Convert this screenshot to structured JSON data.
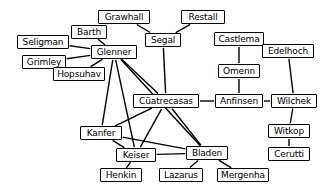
{
  "diagram": {
    "type": "undirected-node-link-graph",
    "width": 330,
    "height": 192,
    "background_color": "#ffffff",
    "node_fill_color": "#ffffff",
    "node_border_color": "#000000",
    "edge_color": "#000000"
  },
  "nodes": [
    {
      "id": "grawhall",
      "label": "Grawhall",
      "x": 124,
      "y": 17,
      "w": 52,
      "h": 14
    },
    {
      "id": "restall",
      "label": "Restall",
      "x": 203,
      "y": 17,
      "w": 44,
      "h": 14
    },
    {
      "id": "barth",
      "label": "Barth",
      "x": 89,
      "y": 32,
      "w": 36,
      "h": 14
    },
    {
      "id": "segal",
      "label": "Segal",
      "x": 163,
      "y": 40,
      "w": 36,
      "h": 14
    },
    {
      "id": "castlema",
      "label": "Castlema",
      "x": 239,
      "y": 39,
      "w": 50,
      "h": 14
    },
    {
      "id": "seligman",
      "label": "Seligman",
      "x": 43,
      "y": 42,
      "w": 52,
      "h": 14
    },
    {
      "id": "edelhoch",
      "label": "Edelhoch",
      "x": 288,
      "y": 51,
      "w": 52,
      "h": 14
    },
    {
      "id": "glenner",
      "label": "Glenner",
      "x": 114,
      "y": 52,
      "w": 46,
      "h": 14
    },
    {
      "id": "grimley",
      "label": "Grimley",
      "x": 44,
      "y": 62,
      "w": 44,
      "h": 14
    },
    {
      "id": "omenn",
      "label": "Omenn",
      "x": 239,
      "y": 71,
      "w": 42,
      "h": 14
    },
    {
      "id": "hopsuhav",
      "label": "Hopsuhav",
      "x": 79,
      "y": 74,
      "w": 52,
      "h": 14
    },
    {
      "id": "cuatrecasas",
      "label": "Cüatrecasas",
      "x": 166,
      "y": 101,
      "w": 66,
      "h": 14
    },
    {
      "id": "anfinsen",
      "label": "Anfinsen",
      "x": 239,
      "y": 101,
      "w": 48,
      "h": 14
    },
    {
      "id": "wilchek",
      "label": "Wilchek",
      "x": 294,
      "y": 101,
      "w": 46,
      "h": 14
    },
    {
      "id": "witkop",
      "label": "Witkop",
      "x": 289,
      "y": 131,
      "w": 42,
      "h": 14
    },
    {
      "id": "kanfer",
      "label": "Kanfer",
      "x": 101,
      "y": 133,
      "w": 42,
      "h": 14
    },
    {
      "id": "cerutti",
      "label": "Cerutti",
      "x": 289,
      "y": 154,
      "w": 42,
      "h": 14
    },
    {
      "id": "keiser",
      "label": "Keiser",
      "x": 136,
      "y": 155,
      "w": 40,
      "h": 14
    },
    {
      "id": "bladen",
      "label": "Bladen",
      "x": 207,
      "y": 153,
      "w": 42,
      "h": 14
    },
    {
      "id": "henkin",
      "label": "Henkin",
      "x": 121,
      "y": 175,
      "w": 42,
      "h": 14
    },
    {
      "id": "lazarus",
      "label": "Lazarus",
      "x": 181,
      "y": 175,
      "w": 44,
      "h": 14
    },
    {
      "id": "mergenha",
      "label": "Mergenha",
      "x": 243,
      "y": 175,
      "w": 52,
      "h": 14
    }
  ],
  "edges": [
    {
      "from": "grawhall",
      "to": "segal"
    },
    {
      "from": "restall",
      "to": "segal"
    },
    {
      "from": "segal",
      "to": "cuatrecasas"
    },
    {
      "from": "barth",
      "to": "glenner"
    },
    {
      "from": "seligman",
      "to": "glenner"
    },
    {
      "from": "grimley",
      "to": "glenner"
    },
    {
      "from": "hopsuhav",
      "to": "glenner"
    },
    {
      "from": "glenner",
      "to": "cuatrecasas"
    },
    {
      "from": "glenner",
      "to": "kanfer"
    },
    {
      "from": "glenner",
      "to": "keiser"
    },
    {
      "from": "glenner",
      "to": "bladen"
    },
    {
      "from": "castlema",
      "to": "omenn"
    },
    {
      "from": "omenn",
      "to": "anfinsen"
    },
    {
      "from": "cuatrecasas",
      "to": "anfinsen"
    },
    {
      "from": "anfinsen",
      "to": "wilchek"
    },
    {
      "from": "edelhoch",
      "to": "wilchek"
    },
    {
      "from": "wilchek",
      "to": "witkop"
    },
    {
      "from": "witkop",
      "to": "cerutti"
    },
    {
      "from": "cuatrecasas",
      "to": "kanfer"
    },
    {
      "from": "cuatrecasas",
      "to": "keiser"
    },
    {
      "from": "cuatrecasas",
      "to": "bladen"
    },
    {
      "from": "kanfer",
      "to": "keiser"
    },
    {
      "from": "kanfer",
      "to": "bladen"
    },
    {
      "from": "keiser",
      "to": "bladen"
    },
    {
      "from": "keiser",
      "to": "henkin"
    },
    {
      "from": "bladen",
      "to": "lazarus"
    },
    {
      "from": "bladen",
      "to": "mergenha"
    }
  ]
}
